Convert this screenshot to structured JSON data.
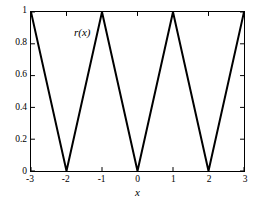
{
  "chart_data": {
    "type": "line",
    "title": "",
    "subtitle": "",
    "xlabel": "x",
    "ylabel": "",
    "annotation": "r(x)",
    "grid": false,
    "legend_position": "none",
    "xlim": [
      -3,
      3
    ],
    "ylim": [
      0,
      1
    ],
    "xticks": [
      -3,
      -2,
      -1,
      0,
      1,
      2,
      3
    ],
    "xticklabels": [
      "-3",
      "-2",
      "-1",
      "0",
      "1",
      "2",
      "3"
    ],
    "yticks": [
      0,
      0.2,
      0.4,
      0.6,
      0.8,
      1
    ],
    "yticklabels": [
      "0",
      "0.2",
      "0.4",
      "0.6",
      "0.8",
      "1"
    ],
    "line_color": "#000000",
    "line_width": 2,
    "series": [
      {
        "name": "r(x)",
        "x": [
          -3,
          -2,
          -1,
          0,
          1,
          2,
          3
        ],
        "values": [
          1,
          0,
          1,
          0,
          1,
          0,
          1
        ]
      }
    ]
  },
  "axis": {
    "frame_color": "#000000",
    "background": "#ffffff"
  }
}
